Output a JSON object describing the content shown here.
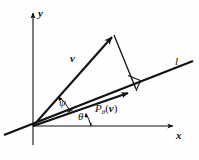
{
  "figure": {
    "background_color": "#fefefe",
    "stroke_color": "#111111",
    "labels": {
      "y_axis": "y",
      "x_axis": "x",
      "line": "l",
      "vector": "v",
      "angle_psi": "ψ",
      "angle_theta": "θ",
      "projection_P": "P",
      "projection_sub": "θ",
      "projection_open": "(",
      "projection_vec": "v",
      "projection_close": ")"
    },
    "geometry": {
      "origin": [
        33,
        126
      ],
      "y_axis_from": [
        33,
        145
      ],
      "y_axis_to": [
        33,
        12
      ],
      "x_axis_from": [
        33,
        126
      ],
      "x_axis_to": [
        174,
        126
      ],
      "line_l_from": [
        4,
        135
      ],
      "line_l_to": [
        193,
        61
      ],
      "vector_tip": [
        114,
        34
      ],
      "perp_foot": [
        135,
        87
      ],
      "projection_tip": [
        130,
        92
      ],
      "right_angle_marker": [
        [
          129,
          76
        ],
        [
          141,
          81
        ],
        [
          136,
          90
        ]
      ],
      "arc_psi_radius": 38,
      "arc_theta_radius": 58
    }
  }
}
